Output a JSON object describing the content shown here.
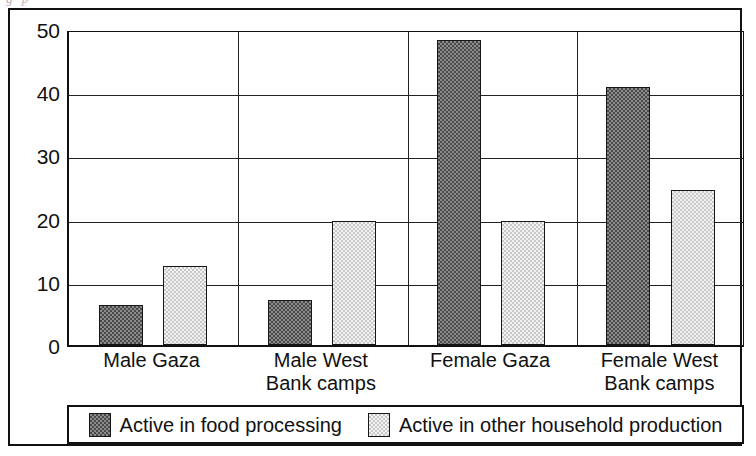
{
  "scan_remnant": "g  p",
  "chart_data": {
    "type": "bar",
    "title": "",
    "subtitle": "",
    "xlabel": "",
    "ylabel": "",
    "ylim": [
      0,
      50
    ],
    "yticks": [
      0,
      10,
      20,
      30,
      40,
      50
    ],
    "ytick_labels": [
      "0",
      "10",
      "20",
      "30",
      "40",
      "50"
    ],
    "grid": true,
    "grid_axis": "y",
    "legend_position": "bottom",
    "categories": [
      "Male Gaza",
      "Male West\nBank camps",
      "Female Gaza",
      "Female West\nBank camps"
    ],
    "series": [
      {
        "name": "Active in food processing",
        "color": "#6e6e6e",
        "pattern": "dark-checker",
        "values": [
          6.3,
          7.2,
          48.2,
          40.8
        ]
      },
      {
        "name": "Active in other household production",
        "color": "#e8e8e8",
        "pattern": "light-checker",
        "values": [
          12.5,
          19.7,
          19.7,
          24.5
        ]
      }
    ]
  },
  "legend": {
    "entries": [
      {
        "label": "Active in food processing",
        "swatch": "dark"
      },
      {
        "label": "Active in other household production",
        "swatch": "light"
      }
    ]
  }
}
